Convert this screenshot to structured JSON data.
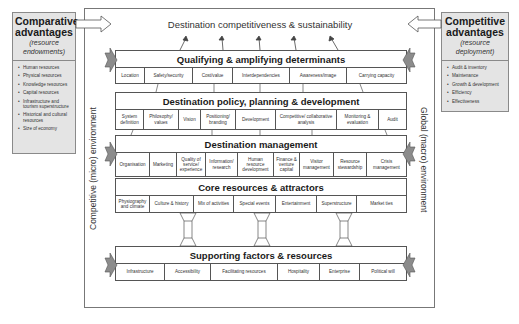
{
  "diagram": {
    "top_title": "Destination competitiveness & sustainability",
    "left_environment": "Competitive (micro) environment",
    "right_environment": "Global (macro) environment"
  },
  "comparative": {
    "title_line1": "Comparative",
    "title_line2": "advantages",
    "subtitle_line1": "(resource",
    "subtitle_line2": "endowments)",
    "items": [
      "Human resources",
      "Physical resources",
      "Knowledge resources",
      "Capital resources",
      "Infrastructure and tourism superstructure",
      "Historical and cultural resources",
      "Size of economy"
    ]
  },
  "competitive": {
    "title_line1": "Competitive",
    "title_line2": "advantages",
    "subtitle_line1": "(resource",
    "subtitle_line2": "deployment)",
    "items": [
      "Audit & inventory",
      "Maintenance",
      "Growth & development",
      "Efficiency",
      "Effectiveness"
    ]
  },
  "bands": {
    "qualifying": {
      "title": "Qualifying & amplifying determinants",
      "cells": [
        "Location",
        "Safety/security",
        "Cost/value",
        "Interdependencies",
        "Awareness/image",
        "Carrying capacity"
      ]
    },
    "policy": {
      "title": "Destination policy, planning & development",
      "cells": [
        "System definition",
        "Philosophy/ values",
        "Vision",
        "Positioning/ branding",
        "Development",
        "Competitive/ collaborative analysis",
        "Monitoring & evaluation",
        "Audit"
      ]
    },
    "management": {
      "title": "Destination management",
      "cells": [
        "Organisation",
        "Marketing",
        "Quality of service/ experience",
        "Information/ research",
        "Human resource development",
        "Finance & venture capital",
        "Visitor management",
        "Resource stewardship",
        "Crisis management"
      ]
    },
    "core": {
      "title": "Core resources & attractors",
      "cells": [
        "Physiography and climate",
        "Culture & history",
        "Mix of activities",
        "Special events",
        "Entertainment",
        "Superstructure",
        "Market ties"
      ]
    },
    "supporting": {
      "title": "Supporting factors & resources",
      "cells": [
        "Infrastructure",
        "Accessibility",
        "Facilitating resources",
        "Hospitality",
        "Enterprise",
        "Political will"
      ]
    }
  },
  "colors": {
    "side_box_fill": "#e4e4e4",
    "arrow_fill": "#8c8c8c",
    "line": "#555555"
  }
}
